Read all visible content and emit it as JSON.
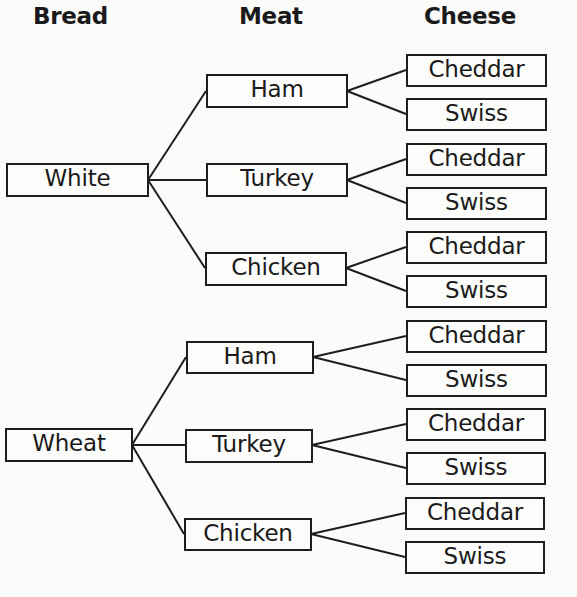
{
  "headers": {
    "bread": "Bread",
    "meat": "Meat",
    "cheese": "Cheese"
  },
  "tree": [
    {
      "bread": "White",
      "meats": [
        {
          "name": "Ham",
          "cheeses": [
            "Cheddar",
            "Swiss"
          ]
        },
        {
          "name": "Turkey",
          "cheeses": [
            "Cheddar",
            "Swiss"
          ]
        },
        {
          "name": "Chicken",
          "cheeses": [
            "Cheddar",
            "Swiss"
          ]
        }
      ]
    },
    {
      "bread": "Wheat",
      "meats": [
        {
          "name": "Ham",
          "cheeses": [
            "Cheddar",
            "Swiss"
          ]
        },
        {
          "name": "Turkey",
          "cheeses": [
            "Cheddar",
            "Swiss"
          ]
        },
        {
          "name": "Chicken",
          "cheeses": [
            "Cheddar",
            "Swiss"
          ]
        }
      ]
    }
  ]
}
